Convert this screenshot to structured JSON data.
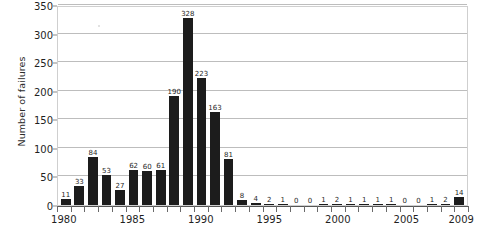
{
  "chart_data": {
    "type": "bar",
    "title": "",
    "xlabel": "",
    "ylabel": "Number of failures",
    "categories": [
      1980,
      1981,
      1982,
      1983,
      1984,
      1985,
      1986,
      1987,
      1988,
      1989,
      1990,
      1991,
      1992,
      1993,
      1994,
      1995,
      1996,
      1997,
      1998,
      1999,
      2000,
      2001,
      2002,
      2003,
      2004,
      2005,
      2006,
      2007,
      2008,
      2009
    ],
    "values": [
      11,
      33,
      84,
      53,
      27,
      62,
      60,
      61,
      190,
      328,
      223,
      163,
      81,
      8,
      4,
      2,
      1,
      0,
      0,
      1,
      2,
      1,
      1,
      1,
      1,
      0,
      0,
      1,
      2,
      14
    ],
    "data_labels": [
      "11",
      "33",
      "84",
      "53",
      "27",
      "62",
      "60",
      "61",
      "190",
      "328",
      "223",
      "163",
      "81",
      "8",
      "4",
      "2",
      "1",
      "0",
      "0",
      "1",
      "2",
      "1",
      "1",
      "1",
      "1",
      "0",
      "0",
      "1",
      "2",
      "14"
    ],
    "ylim": [
      0,
      350
    ],
    "ytick_values": [
      0,
      50,
      100,
      150,
      200,
      250,
      300,
      350
    ],
    "ytick_labels": [
      "0",
      "50",
      "100",
      "150",
      "200",
      "250",
      "300",
      "350"
    ],
    "xtick_values": [
      1980,
      1985,
      1990,
      1995,
      2000,
      2005,
      2009
    ],
    "xtick_labels": [
      "1980",
      "1985",
      "1990",
      "1995",
      "2000",
      "2005",
      "2009"
    ],
    "grid": true,
    "grid_axis": "y",
    "legend": null,
    "bar_color": "#1c1c1c",
    "grid_color": "#bdbdbd",
    "frame_color": "#cfcfcf",
    "background_color": "#ffffff"
  }
}
